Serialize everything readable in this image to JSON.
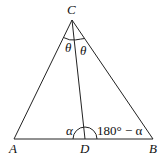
{
  "diagram": {
    "type": "triangle-with-cevian",
    "vertices": {
      "C": {
        "label": "C",
        "x": 72,
        "y": 20
      },
      "A": {
        "label": "A",
        "x": 14,
        "y": 139
      },
      "B": {
        "label": "B",
        "x": 153,
        "y": 139
      },
      "D": {
        "label": "D",
        "x": 85,
        "y": 139
      }
    },
    "segments": [
      "CA",
      "CB",
      "AB",
      "CD"
    ],
    "angles": {
      "ACD": {
        "label": "θ"
      },
      "DCB": {
        "label": "θ"
      },
      "CDA": {
        "label": "α"
      },
      "CDB": {
        "label": "180° − α"
      }
    }
  },
  "labels": {
    "C": "C",
    "A": "A",
    "B": "B",
    "D": "D",
    "theta_left": "θ",
    "theta_right": "θ",
    "alpha": "α",
    "supplement": "180° − α"
  }
}
